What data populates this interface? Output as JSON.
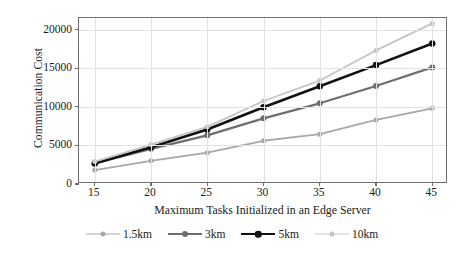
{
  "chart_data": {
    "type": "line",
    "title": "",
    "xlabel": "Maximum Tasks Initialized in an Edge Server",
    "ylabel": "Communication Cost",
    "x": [
      15,
      20,
      25,
      30,
      35,
      40,
      45
    ],
    "xlim": [
      13.6,
      46.4
    ],
    "ylim": [
      0,
      21500
    ],
    "xticks": [
      "15",
      "20",
      "25",
      "30",
      "35",
      "40",
      "45"
    ],
    "yticks": [
      "0",
      "5000",
      "10000",
      "15000",
      "20000"
    ],
    "ytick_values": [
      0,
      5000,
      10000,
      15000,
      20000
    ],
    "grid": "horizontal-and-vertical",
    "legend_position": "bottom",
    "marker": "circle",
    "series": [
      {
        "name": "1.5km",
        "color": "#a8a8a8",
        "linewidth": 1.8,
        "markersize": 5,
        "values": [
          1800,
          3000,
          4050,
          5600,
          6450,
          8300,
          9800
        ]
      },
      {
        "name": "3km",
        "color": "#6e6e6e",
        "linewidth": 2.2,
        "markersize": 6,
        "values": [
          2700,
          4550,
          6300,
          8500,
          10450,
          12700,
          15100
        ]
      },
      {
        "name": "5km",
        "color": "#111111",
        "linewidth": 2.6,
        "markersize": 6.5,
        "values": [
          2650,
          4750,
          7050,
          9950,
          12650,
          15400,
          18200
        ]
      },
      {
        "name": "10km",
        "color": "#c4c4c4",
        "linewidth": 1.8,
        "markersize": 5,
        "values": [
          2900,
          5100,
          7400,
          10750,
          13400,
          17300,
          20800
        ]
      }
    ]
  },
  "axis": {
    "frame_color": "#6e6e6e",
    "grid_color": "#e2e2e2"
  }
}
